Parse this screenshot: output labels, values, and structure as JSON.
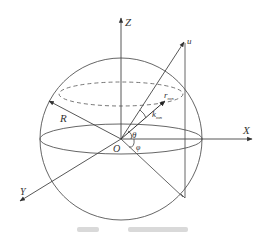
{
  "diagram": {
    "labels": {
      "z_axis": "Z",
      "x_axis": "X",
      "y_axis": "Y",
      "origin": "O",
      "radius": "R",
      "u_vector": "u",
      "r_vector": "r",
      "r_subscript": "mn",
      "k_vector": "k",
      "k_subscript": "mn",
      "theta": "θ",
      "phi": "φ"
    },
    "colors": {
      "line": "#555555",
      "text": "#333333",
      "background": "#ffffff"
    }
  }
}
